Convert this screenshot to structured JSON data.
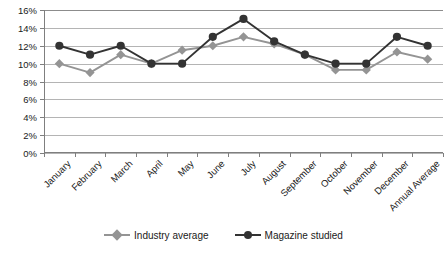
{
  "chart_data": {
    "type": "line",
    "title": "",
    "xlabel": "",
    "ylabel": "",
    "ylim": [
      0,
      16
    ],
    "ytick_step": 2,
    "ytick_labels": [
      "0%",
      "2%",
      "4%",
      "6%",
      "8%",
      "10%",
      "12%",
      "14%",
      "16%"
    ],
    "grid": true,
    "legend_position": "bottom-center",
    "categories": [
      "January",
      "February",
      "March",
      "April",
      "May",
      "June",
      "July",
      "August",
      "September",
      "October",
      "November",
      "December",
      "Annual Average"
    ],
    "series": [
      {
        "name": "Industry average",
        "color": "#949494",
        "marker": "diamond",
        "values": [
          10.0,
          9.0,
          11.0,
          10.0,
          11.5,
          12.0,
          13.0,
          12.2,
          11.0,
          9.3,
          9.3,
          11.3,
          10.5
        ]
      },
      {
        "name": "Magazine studied",
        "color": "#333333",
        "marker": "circle",
        "values": [
          12.0,
          11.0,
          12.0,
          10.0,
          10.0,
          13.0,
          15.0,
          12.5,
          11.0,
          10.0,
          10.0,
          13.0,
          12.0
        ]
      }
    ]
  },
  "axis": {
    "line_color": "#7f7f7f",
    "grid_color": "#b4b4b4"
  }
}
